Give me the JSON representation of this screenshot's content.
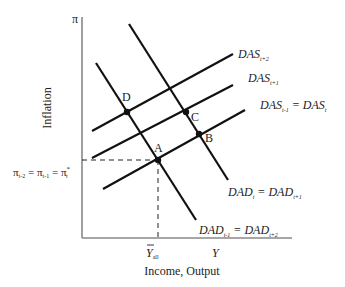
{
  "diagram": {
    "axes": {
      "y_label": "Inflation",
      "y_symbol": "π",
      "x_label": "Income, Output",
      "x_symbol": "Y",
      "x_marker": {
        "base": "Y",
        "sub": "all",
        "overbar": true
      },
      "y_marker": "π_{t-2} = π_{t-1} = π*_t"
    },
    "y_marker_parts": {
      "p1": "π",
      "s1": "t-2",
      "eq1": " = ",
      "p2": "π",
      "s2": "t-1",
      "eq2": " = ",
      "p3": "π",
      "s3": "t",
      "sup3": "*"
    },
    "curves": {
      "das_t2": {
        "base": "DAS",
        "sub": "t+2"
      },
      "das_t1": {
        "base": "DAS",
        "sub": "t+1"
      },
      "das_t": {
        "base1": "DAS",
        "sub1": "t-1",
        "eq": " = ",
        "base2": "DAS",
        "sub2": "t"
      },
      "dad_upper": {
        "base1": "DAD",
        "sub1": "t",
        "eq": " = ",
        "base2": "DAD",
        "sub2": "t+1"
      },
      "dad_lower": {
        "base1": "DAD",
        "sub1": "t-1",
        "eq": " = ",
        "base2": "DAD",
        "sub2": "t+2"
      }
    },
    "points": {
      "A": "A",
      "B": "B",
      "C": "C",
      "D": "D"
    },
    "colors": {
      "line": "#111111",
      "axis": "#888888"
    }
  }
}
